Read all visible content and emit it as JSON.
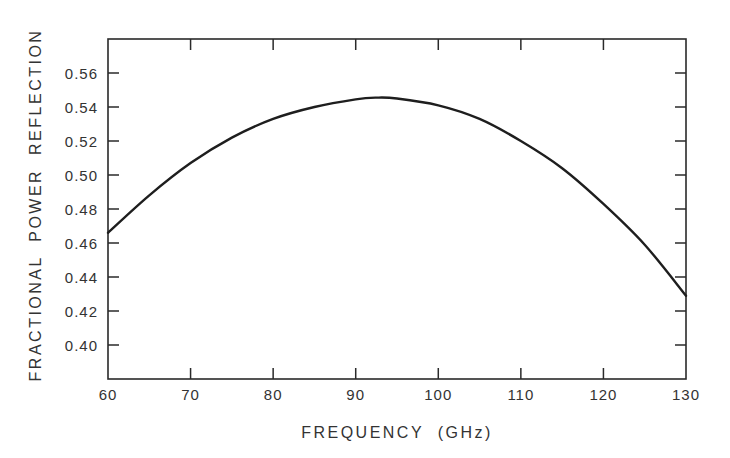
{
  "chart_data": {
    "type": "line",
    "title": "",
    "xlabel": "FREQUENCY  (GHz)",
    "ylabel": "FRACTIONAL  POWER  REFLECTION",
    "xlim": [
      60,
      130
    ],
    "ylim": [
      0.38,
      0.58
    ],
    "x_ticks": [
      60,
      70,
      80,
      90,
      100,
      110,
      120,
      130
    ],
    "x_tick_labels": [
      "60",
      "70",
      "80",
      "90",
      "100",
      "110",
      "120",
      "130"
    ],
    "y_ticks": [
      0.4,
      0.42,
      0.44,
      0.46,
      0.48,
      0.5,
      0.52,
      0.54,
      0.56
    ],
    "y_tick_labels": [
      "0.40",
      "0.42",
      "0.44",
      "0.46",
      "0.48",
      "0.50",
      "0.52",
      "0.54",
      "0.56"
    ],
    "grid": false,
    "legend": null,
    "series": [
      {
        "name": "Fractional power reflection",
        "color": "#1e1e1e",
        "x": [
          60,
          65,
          70,
          75,
          80,
          85,
          90,
          92.5,
          95,
          100,
          105,
          110,
          115,
          120,
          125,
          130
        ],
        "values": [
          0.466,
          0.488,
          0.507,
          0.522,
          0.533,
          0.54,
          0.5445,
          0.5455,
          0.545,
          0.541,
          0.533,
          0.52,
          0.504,
          0.483,
          0.459,
          0.429
        ]
      }
    ]
  },
  "colors": {
    "axis": "#2a2a2a",
    "curve": "#1e1e1e",
    "background": "#ffffff"
  }
}
